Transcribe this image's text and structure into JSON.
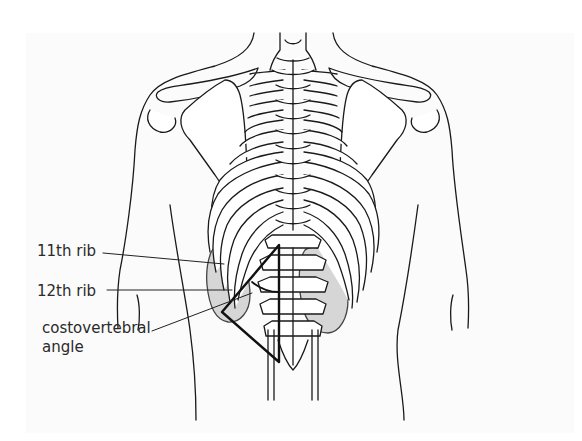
{
  "figure": {
    "labels": {
      "rib11": "11th rib",
      "rib12": "12th rib",
      "cva_line1": "costovertebral",
      "cva_line2": "angle"
    },
    "colors": {
      "outline": "#1a1a1a",
      "kidney_fill": "#d6d6d6",
      "bone_fill": "#ffffff",
      "background": "#ffffff",
      "triangle": "#111111"
    }
  }
}
